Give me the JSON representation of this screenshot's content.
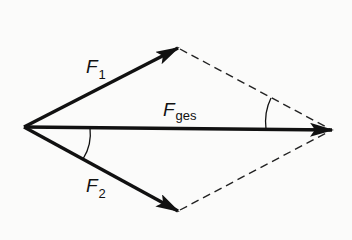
{
  "diagram": {
    "type": "force-parallelogram",
    "colors": {
      "ink": "#111111",
      "background": "#fbfbfa"
    },
    "origin": {
      "x": 24,
      "y": 127
    },
    "vectors": [
      {
        "id": "F1",
        "symbol": "F",
        "subscript": "1",
        "tip": {
          "x": 178,
          "y": 48
        }
      },
      {
        "id": "F2",
        "symbol": "F",
        "subscript": "2",
        "tip": {
          "x": 178,
          "y": 211
        }
      },
      {
        "id": "Fges",
        "symbol": "F",
        "subscript": "ges",
        "tip": {
          "x": 332,
          "y": 130
        }
      }
    ],
    "construction_lines": [
      {
        "from": "F1",
        "to": "Fges",
        "style": "dashed"
      },
      {
        "from": "F2",
        "to": "Fges",
        "style": "dashed"
      }
    ],
    "angle_arcs": [
      {
        "between": [
          "Fges",
          "F2"
        ],
        "at": "origin"
      },
      {
        "between": [
          "Fges",
          "dashed-F1-parallel"
        ],
        "at": "Fges-tip"
      }
    ]
  },
  "labels": {
    "f1": {
      "main": "F",
      "sub": "1"
    },
    "f2": {
      "main": "F",
      "sub": "2"
    },
    "fges": {
      "main": "F",
      "sub": "ges"
    }
  }
}
